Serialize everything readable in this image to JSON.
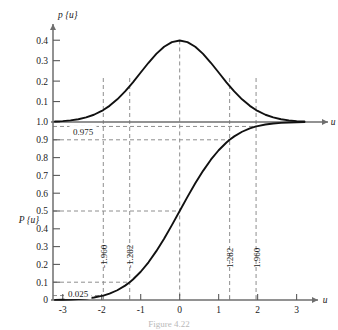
{
  "figure": {
    "caption": "Figure 4.22",
    "axis_x_label": "u",
    "axis_x_label_top": "u",
    "pdf_axis_label": "p {u}",
    "cdf_axis_label": "P {u}"
  },
  "axes": {
    "x_ticks": [
      "-3",
      "-2",
      "-1",
      "0",
      "1",
      "2",
      "3"
    ],
    "x_values": [
      -3,
      -2,
      -1,
      0,
      1,
      2,
      3
    ],
    "x_range": [
      -3.25,
      3.6
    ],
    "pdf_y_ticks": [
      "0.1",
      "0.2",
      "0.3",
      "0.4"
    ],
    "pdf_y_values": [
      0.1,
      0.2,
      0.3,
      0.4
    ],
    "pdf_y_range": [
      0,
      0.45
    ],
    "cdf_y_ticks": [
      "0.1",
      "0.2",
      "0.3",
      "0.4",
      "0.5",
      "0.6",
      "0.7",
      "0.8",
      "0.9",
      "1.0"
    ],
    "cdf_y_values": [
      0.1,
      0.2,
      0.3,
      0.4,
      0.5,
      0.6,
      0.7,
      0.8,
      0.9,
      1.0
    ],
    "cdf_y_origin_label": "0",
    "cdf_y_range": [
      0,
      1.0
    ]
  },
  "markers": {
    "vertical": [
      {
        "label": "-1.960",
        "value": -1.96
      },
      {
        "label": "-1.282",
        "value": -1.282
      },
      {
        "label": "",
        "value": 0
      },
      {
        "label": "1.282",
        "value": 1.282
      },
      {
        "label": "1.960",
        "value": 1.96
      }
    ],
    "horizontal": [
      {
        "label": "0.975",
        "value": 0.975
      },
      {
        "label": "",
        "value": 0.9
      },
      {
        "label": "",
        "value": 0.5
      },
      {
        "label": "",
        "value": 0.1
      },
      {
        "label": "0.025",
        "value": 0.025
      }
    ]
  },
  "chart_data": {
    "type": "line",
    "xlabel": "u",
    "ylabel": "p {u} / P {u}",
    "xlim": [
      -3.25,
      3.6
    ],
    "grid": false,
    "legend": "none",
    "annotations": [
      "0.975",
      "0.025",
      "-1.960",
      "-1.282",
      "1.282",
      "1.960"
    ],
    "series": [
      {
        "name": "p {u}",
        "type": "pdf",
        "ylim": [
          0,
          0.45
        ],
        "x": [
          -3.2,
          -3.0,
          -2.8,
          -2.6,
          -2.4,
          -2.2,
          -2.0,
          -1.96,
          -1.8,
          -1.6,
          -1.4,
          -1.282,
          -1.2,
          -1.0,
          -0.8,
          -0.6,
          -0.4,
          -0.2,
          0.0,
          0.2,
          0.4,
          0.6,
          0.8,
          1.0,
          1.2,
          1.282,
          1.4,
          1.6,
          1.8,
          1.96,
          2.0,
          2.2,
          2.4,
          2.6,
          2.8,
          3.0,
          3.2
        ],
        "y": [
          0.0024,
          0.0044,
          0.0079,
          0.0136,
          0.0224,
          0.0355,
          0.054,
          0.0584,
          0.079,
          0.1109,
          0.1497,
          0.1755,
          0.1942,
          0.242,
          0.2897,
          0.3332,
          0.3683,
          0.391,
          0.3989,
          0.391,
          0.3683,
          0.3332,
          0.2897,
          0.242,
          0.1942,
          0.1755,
          0.1497,
          0.1109,
          0.079,
          0.0584,
          0.054,
          0.0355,
          0.0224,
          0.0136,
          0.0079,
          0.0044,
          0.0024
        ]
      },
      {
        "name": "P {u}",
        "type": "cdf",
        "ylim": [
          0,
          1.0
        ],
        "x": [
          -3.2,
          -3.0,
          -2.8,
          -2.6,
          -2.4,
          -2.2,
          -2.0,
          -1.96,
          -1.8,
          -1.6,
          -1.4,
          -1.282,
          -1.2,
          -1.0,
          -0.8,
          -0.6,
          -0.4,
          -0.2,
          0.0,
          0.2,
          0.4,
          0.6,
          0.8,
          1.0,
          1.2,
          1.282,
          1.4,
          1.6,
          1.8,
          1.96,
          2.0,
          2.2,
          2.4,
          2.6,
          2.8,
          3.0,
          3.2
        ],
        "y": [
          0.0007,
          0.0013,
          0.0026,
          0.0047,
          0.0082,
          0.0139,
          0.0228,
          0.025,
          0.0359,
          0.0548,
          0.0808,
          0.1,
          0.1151,
          0.1587,
          0.2119,
          0.2743,
          0.3446,
          0.4207,
          0.5,
          0.5793,
          0.6554,
          0.7257,
          0.7881,
          0.8413,
          0.8849,
          0.9,
          0.9192,
          0.9452,
          0.9641,
          0.975,
          0.9772,
          0.9861,
          0.9918,
          0.9953,
          0.9974,
          0.9987,
          0.9993
        ]
      }
    ],
    "reference_points": [
      {
        "u": -1.96,
        "P": 0.025
      },
      {
        "u": -1.282,
        "P": 0.1
      },
      {
        "u": 0.0,
        "P": 0.5
      },
      {
        "u": 1.282,
        "P": 0.9
      },
      {
        "u": 1.96,
        "P": 0.975
      }
    ]
  }
}
